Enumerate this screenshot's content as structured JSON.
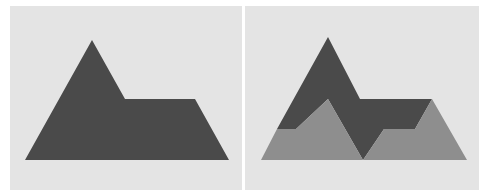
{
  "colors": {
    "background": "#e4e4e4",
    "dark_shape": "#4a4a4a",
    "light_shape": "#8e8e8e",
    "divider": "#ffffff"
  },
  "panels": [
    {
      "id": "left",
      "shapes": [
        {
          "name": "combined-mountain-shape",
          "fill": "dark",
          "points": "25,160 92,40 125,99 195,99 229,160"
        }
      ]
    },
    {
      "id": "right",
      "shapes": [
        {
          "name": "dark-upper-shape",
          "fill": "dark",
          "points": "277,129 328,37 360,99 432,99 415,129 384,129 363,160 328,99 296,129"
        },
        {
          "name": "light-left-peak-shape",
          "fill": "light",
          "points": "261,160 277,129 296,129 328,99 363,160"
        },
        {
          "name": "light-right-trapezoid-shape",
          "fill": "light",
          "points": "363,160 384,129 415,129 432,99 467,160"
        }
      ]
    }
  ]
}
